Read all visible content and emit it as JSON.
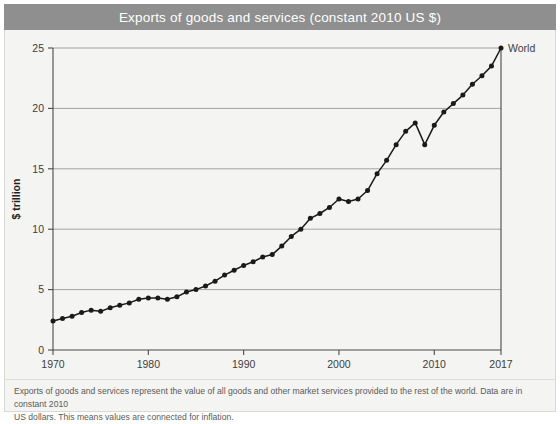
{
  "title": "Exports of goods and services (constant 2010 US $)",
  "caption": {
    "line1": "Exports of goods and services represent the value of all goods and other market services provided to the rest of the world. Data are in constant 2010",
    "line2": "US dollars. This means values are connected for inflation."
  },
  "colors": {
    "title_bar": "#8f8f8f",
    "title_text": "#ffffff",
    "panel_bg": "#f4f4f2",
    "series": "#1a1a1a",
    "grid": "#9a9a9a",
    "axis": "#4a4a4a"
  },
  "chart_data": {
    "type": "line",
    "title": "Exports of goods and services (constant 2010 US $)",
    "xlabel": "",
    "ylabel": "$ trillion",
    "xlim": [
      1970,
      2017
    ],
    "ylim": [
      0,
      25
    ],
    "grid": true,
    "legend": "inline-end-label",
    "series_name": "World",
    "x_tick_labels": [
      "1970",
      "1980",
      "1990",
      "2000",
      "2010",
      "2017"
    ],
    "x_ticks": [
      1970,
      1980,
      1990,
      2000,
      2010,
      2017
    ],
    "y_tick_labels": [
      "0",
      "5",
      "10",
      "15",
      "20",
      "25"
    ],
    "y_ticks": [
      0,
      5,
      10,
      15,
      20,
      25
    ],
    "x": [
      1970,
      1971,
      1972,
      1973,
      1974,
      1975,
      1976,
      1977,
      1978,
      1979,
      1980,
      1981,
      1982,
      1983,
      1984,
      1985,
      1986,
      1987,
      1988,
      1989,
      1990,
      1991,
      1992,
      1993,
      1994,
      1995,
      1996,
      1997,
      1998,
      1999,
      2000,
      2001,
      2002,
      2003,
      2004,
      2005,
      2006,
      2007,
      2008,
      2009,
      2010,
      2011,
      2012,
      2013,
      2014,
      2015,
      2016,
      2017
    ],
    "values": [
      2.4,
      2.6,
      2.8,
      3.1,
      3.3,
      3.2,
      3.5,
      3.7,
      3.9,
      4.2,
      4.3,
      4.3,
      4.2,
      4.4,
      4.8,
      5.0,
      5.3,
      5.7,
      6.2,
      6.6,
      7.0,
      7.3,
      7.7,
      7.9,
      8.6,
      9.4,
      10.0,
      10.9,
      11.3,
      11.8,
      12.5,
      12.3,
      12.5,
      13.2,
      14.6,
      15.7,
      17.0,
      18.1,
      18.8,
      17.0,
      18.6,
      19.7,
      20.4,
      21.1,
      22.0,
      22.7,
      23.5,
      25.0
    ],
    "annotations": [
      {
        "label": "World",
        "x": 2017,
        "y": 25.0
      }
    ]
  }
}
